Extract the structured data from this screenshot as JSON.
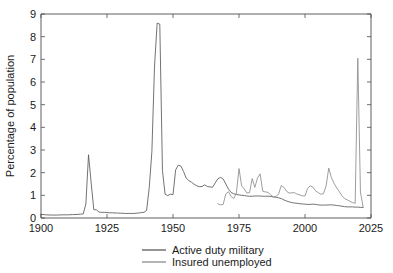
{
  "chart_data": {
    "type": "line",
    "title": "",
    "xlabel": "",
    "ylabel": "Percentage of population",
    "xlim": [
      1900,
      2025
    ],
    "ylim": [
      0,
      9
    ],
    "grid": false,
    "legend_position": "bottom-center",
    "xticks": [
      1900,
      1925,
      1950,
      1975,
      2000,
      2025
    ],
    "yticks": [
      0,
      1,
      2,
      3,
      4,
      5,
      6,
      7,
      8,
      9
    ],
    "colors": {
      "active_duty_military": "#5a5a5a",
      "insured_unemployed": "#8c8c8c",
      "axis": "#4d4d4d",
      "background": "#ffffff"
    },
    "series": [
      {
        "name": "Active duty military",
        "color": "#5a5a5a",
        "points": [
          [
            1900,
            0.16
          ],
          [
            1902,
            0.14
          ],
          [
            1904,
            0.13
          ],
          [
            1906,
            0.13
          ],
          [
            1908,
            0.14
          ],
          [
            1910,
            0.14
          ],
          [
            1912,
            0.15
          ],
          [
            1914,
            0.16
          ],
          [
            1915,
            0.17
          ],
          [
            1916,
            0.18
          ],
          [
            1917,
            0.62
          ],
          [
            1918,
            2.79
          ],
          [
            1919,
            1.55
          ],
          [
            1920,
            0.37
          ],
          [
            1921,
            0.36
          ],
          [
            1922,
            0.26
          ],
          [
            1923,
            0.25
          ],
          [
            1924,
            0.25
          ],
          [
            1925,
            0.24
          ],
          [
            1926,
            0.23
          ],
          [
            1927,
            0.23
          ],
          [
            1928,
            0.22
          ],
          [
            1929,
            0.22
          ],
          [
            1930,
            0.21
          ],
          [
            1931,
            0.21
          ],
          [
            1932,
            0.2
          ],
          [
            1933,
            0.2
          ],
          [
            1934,
            0.2
          ],
          [
            1935,
            0.2
          ],
          [
            1936,
            0.21
          ],
          [
            1937,
            0.22
          ],
          [
            1938,
            0.24
          ],
          [
            1939,
            0.25
          ],
          [
            1940,
            0.33
          ],
          [
            1941,
            1.34
          ],
          [
            1942,
            2.93
          ],
          [
            1943,
            6.7
          ],
          [
            1944,
            8.6
          ],
          [
            1945,
            8.55
          ],
          [
            1946,
            2.1
          ],
          [
            1947,
            1.05
          ],
          [
            1948,
            0.99
          ],
          [
            1949,
            1.05
          ],
          [
            1950,
            1.03
          ],
          [
            1951,
            2.12
          ],
          [
            1952,
            2.33
          ],
          [
            1953,
            2.29
          ],
          [
            1954,
            2.05
          ],
          [
            1955,
            1.76
          ],
          [
            1956,
            1.65
          ],
          [
            1957,
            1.58
          ],
          [
            1958,
            1.49
          ],
          [
            1959,
            1.42
          ],
          [
            1960,
            1.38
          ],
          [
            1961,
            1.39
          ],
          [
            1962,
            1.46
          ],
          [
            1963,
            1.39
          ],
          [
            1964,
            1.37
          ],
          [
            1965,
            1.36
          ],
          [
            1966,
            1.55
          ],
          [
            1967,
            1.73
          ],
          [
            1968,
            1.79
          ],
          [
            1969,
            1.72
          ],
          [
            1970,
            1.5
          ],
          [
            1971,
            1.28
          ],
          [
            1972,
            1.13
          ],
          [
            1973,
            1.07
          ],
          [
            1974,
            1.04
          ],
          [
            1975,
            1.02
          ],
          [
            1976,
            1.0
          ],
          [
            1977,
            0.99
          ],
          [
            1978,
            0.97
          ],
          [
            1979,
            0.96
          ],
          [
            1980,
            0.96
          ],
          [
            1981,
            0.97
          ],
          [
            1982,
            0.97
          ],
          [
            1983,
            0.97
          ],
          [
            1984,
            0.96
          ],
          [
            1985,
            0.96
          ],
          [
            1986,
            0.96
          ],
          [
            1987,
            0.95
          ],
          [
            1988,
            0.93
          ],
          [
            1989,
            0.92
          ],
          [
            1990,
            0.89
          ],
          [
            1991,
            0.86
          ],
          [
            1992,
            0.8
          ],
          [
            1993,
            0.75
          ],
          [
            1994,
            0.71
          ],
          [
            1995,
            0.68
          ],
          [
            1996,
            0.66
          ],
          [
            1997,
            0.65
          ],
          [
            1998,
            0.63
          ],
          [
            1999,
            0.62
          ],
          [
            2000,
            0.61
          ],
          [
            2001,
            0.6
          ],
          [
            2002,
            0.6
          ],
          [
            2003,
            0.61
          ],
          [
            2004,
            0.6
          ],
          [
            2005,
            0.58
          ],
          [
            2006,
            0.57
          ],
          [
            2007,
            0.57
          ],
          [
            2008,
            0.57
          ],
          [
            2009,
            0.58
          ],
          [
            2010,
            0.58
          ],
          [
            2011,
            0.57
          ],
          [
            2012,
            0.55
          ],
          [
            2013,
            0.54
          ],
          [
            2014,
            0.52
          ],
          [
            2015,
            0.5
          ],
          [
            2016,
            0.49
          ],
          [
            2017,
            0.49
          ],
          [
            2018,
            0.49
          ],
          [
            2019,
            0.48
          ],
          [
            2020,
            0.48
          ],
          [
            2021,
            0.47
          ],
          [
            2022,
            0.46
          ]
        ]
      },
      {
        "name": "Insured unemployed",
        "color": "#8c8c8c",
        "points": [
          [
            1967,
            0.63
          ],
          [
            1968,
            0.58
          ],
          [
            1969,
            0.6
          ],
          [
            1970,
            1.06
          ],
          [
            1971,
            1.16
          ],
          [
            1972,
            0.95
          ],
          [
            1973,
            0.86
          ],
          [
            1974,
            1.1
          ],
          [
            1975,
            2.18
          ],
          [
            1976,
            1.42
          ],
          [
            1977,
            1.28
          ],
          [
            1978,
            1.1
          ],
          [
            1979,
            1.12
          ],
          [
            1980,
            1.74
          ],
          [
            1981,
            1.35
          ],
          [
            1982,
            1.76
          ],
          [
            1983,
            1.95
          ],
          [
            1984,
            1.18
          ],
          [
            1985,
            1.15
          ],
          [
            1986,
            1.13
          ],
          [
            1987,
            1.02
          ],
          [
            1988,
            0.93
          ],
          [
            1989,
            0.94
          ],
          [
            1990,
            1.06
          ],
          [
            1991,
            1.43
          ],
          [
            1992,
            1.35
          ],
          [
            1993,
            1.18
          ],
          [
            1994,
            1.1
          ],
          [
            1995,
            1.11
          ],
          [
            1996,
            1.12
          ],
          [
            1997,
            1.05
          ],
          [
            1998,
            1.02
          ],
          [
            1999,
            0.98
          ],
          [
            2000,
            0.97
          ],
          [
            2001,
            1.31
          ],
          [
            2002,
            1.42
          ],
          [
            2003,
            1.36
          ],
          [
            2004,
            1.2
          ],
          [
            2005,
            1.12
          ],
          [
            2006,
            1.05
          ],
          [
            2007,
            1.07
          ],
          [
            2008,
            1.42
          ],
          [
            2009,
            2.2
          ],
          [
            2010,
            1.78
          ],
          [
            2011,
            1.53
          ],
          [
            2012,
            1.33
          ],
          [
            2013,
            1.16
          ],
          [
            2014,
            0.98
          ],
          [
            2015,
            0.86
          ],
          [
            2016,
            0.8
          ],
          [
            2017,
            0.74
          ],
          [
            2018,
            0.68
          ],
          [
            2019,
            0.65
          ],
          [
            2020,
            7.05
          ],
          [
            2021,
            1.15
          ],
          [
            2022,
            0.48
          ]
        ]
      }
    ],
    "annotations": [
      {
        "label": "WWI peak",
        "x": 1918,
        "y": 2.79
      },
      {
        "label": "WWII peak",
        "x": 1944,
        "y": 8.6
      },
      {
        "label": "Korean War peak",
        "x": 1952,
        "y": 2.33
      },
      {
        "label": "COVID-19 unemployment spike",
        "x": 2020,
        "y": 7.05
      }
    ]
  },
  "legend": {
    "entries": [
      {
        "label": "Active duty military"
      },
      {
        "label": "Insured unemployed"
      }
    ]
  },
  "axes": {
    "y_title": "Percentage of population",
    "x_tick_labels": [
      "1900",
      "1925",
      "1950",
      "1975",
      "2000",
      "2025"
    ],
    "y_tick_labels": [
      "0",
      "1",
      "2",
      "3",
      "4",
      "5",
      "6",
      "7",
      "8",
      "9"
    ]
  }
}
